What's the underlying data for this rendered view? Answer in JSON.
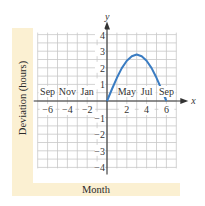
{
  "chart_data": {
    "type": "line",
    "title": "",
    "xlabel": "Month",
    "ylabel": "Deviation (hours)",
    "x_axis_symbol": "x",
    "y_axis_symbol": "y",
    "xlim": [
      -7,
      7
    ],
    "ylim": [
      -4,
      4
    ],
    "grid": true,
    "x_ticks": [
      -6,
      -4,
      -2,
      2,
      4,
      6
    ],
    "x_tick_labels": [
      "−6",
      "−4",
      "−2",
      "2",
      "4",
      "6"
    ],
    "y_ticks": [
      -4,
      -3,
      -2,
      -1,
      1,
      2,
      3,
      4
    ],
    "y_tick_labels": [
      "−4",
      "−3",
      "−2",
      "−1",
      "1",
      "2",
      "3",
      "4"
    ],
    "month_annotations": [
      {
        "label": "Sep",
        "x": -6
      },
      {
        "label": "Nov",
        "x": -4
      },
      {
        "label": "Jan",
        "x": -2
      },
      {
        "label": "May",
        "x": 2
      },
      {
        "label": "Jul",
        "x": 4
      },
      {
        "label": "Sep",
        "x": 6
      }
    ],
    "series": [
      {
        "name": "deviation",
        "color": "#3a7cc2",
        "x": [
          0,
          0.5,
          1,
          1.5,
          2,
          2.5,
          3,
          3.5,
          4,
          4.5,
          5,
          5.5,
          6
        ],
        "y": [
          0,
          0.72,
          1.4,
          1.98,
          2.42,
          2.7,
          2.8,
          2.7,
          2.42,
          1.98,
          1.4,
          0.72,
          0
        ]
      }
    ]
  },
  "colors": {
    "band": "#fbf0d2",
    "grid": "#c8c8c8",
    "axis": "#333333",
    "curve": "#3a7cc2"
  }
}
